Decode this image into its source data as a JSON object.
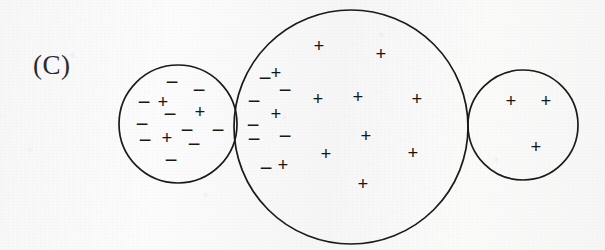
{
  "figure": {
    "panel_label": "(C)",
    "background_color": "#fbfbfb",
    "stroke_color": "#1a1a1a",
    "symbol_color": "#161616",
    "canvas": {
      "width": 605,
      "height": 250
    },
    "circles": [
      {
        "name": "left-circle",
        "cx": 178,
        "cy": 124,
        "r": 59,
        "label": "small left circle"
      },
      {
        "name": "middle-circle",
        "cx": 351,
        "cy": 127,
        "r": 117,
        "label": "large middle circle"
      },
      {
        "name": "right-circle",
        "cx": 523,
        "cy": 125,
        "r": 55,
        "label": "small right circle"
      }
    ],
    "symbols": {
      "left_circle": [
        {
          "sign": "−",
          "x": 172,
          "y": 82
        },
        {
          "sign": "−",
          "x": 199,
          "y": 90
        },
        {
          "sign": "−",
          "x": 144,
          "y": 102
        },
        {
          "sign": "+",
          "x": 163,
          "y": 101
        },
        {
          "sign": "−",
          "x": 170,
          "y": 114
        },
        {
          "sign": "+",
          "x": 200,
          "y": 111
        },
        {
          "sign": "−",
          "x": 142,
          "y": 124
        },
        {
          "sign": "−",
          "x": 187,
          "y": 130
        },
        {
          "sign": "−",
          "x": 218,
          "y": 130
        },
        {
          "sign": "−",
          "x": 145,
          "y": 140
        },
        {
          "sign": "+",
          "x": 167,
          "y": 137
        },
        {
          "sign": "−",
          "x": 194,
          "y": 144
        },
        {
          "sign": "−",
          "x": 171,
          "y": 160
        }
      ],
      "middle_circle_negatives": [
        {
          "sign": "−",
          "x": 265,
          "y": 78
        },
        {
          "sign": "−",
          "x": 285,
          "y": 90
        },
        {
          "sign": "−",
          "x": 254,
          "y": 101
        },
        {
          "sign": "−",
          "x": 253,
          "y": 125
        },
        {
          "sign": "−",
          "x": 254,
          "y": 139
        },
        {
          "sign": "−",
          "x": 285,
          "y": 136
        },
        {
          "sign": "−",
          "x": 266,
          "y": 168
        }
      ],
      "middle_circle_positives": [
        {
          "sign": "+",
          "x": 319,
          "y": 45
        },
        {
          "sign": "+",
          "x": 381,
          "y": 53
        },
        {
          "sign": "+",
          "x": 276,
          "y": 72
        },
        {
          "sign": "+",
          "x": 318,
          "y": 98
        },
        {
          "sign": "+",
          "x": 358,
          "y": 96
        },
        {
          "sign": "+",
          "x": 417,
          "y": 98
        },
        {
          "sign": "+",
          "x": 276,
          "y": 113
        },
        {
          "sign": "+",
          "x": 366,
          "y": 135
        },
        {
          "sign": "+",
          "x": 326,
          "y": 153
        },
        {
          "sign": "+",
          "x": 413,
          "y": 152
        },
        {
          "sign": "+",
          "x": 283,
          "y": 164
        },
        {
          "sign": "+",
          "x": 363,
          "y": 183
        }
      ],
      "right_circle": [
        {
          "sign": "+",
          "x": 511,
          "y": 100
        },
        {
          "sign": "+",
          "x": 546,
          "y": 100
        },
        {
          "sign": "+",
          "x": 536,
          "y": 146
        }
      ]
    }
  }
}
